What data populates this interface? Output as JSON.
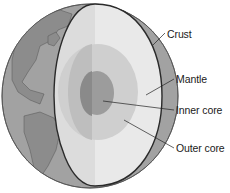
{
  "colors": {
    "background": "#ffffff",
    "globe_ocean": "#9a9a9a",
    "globe_land": "#8a8a8a",
    "outline": "#2a2a2a",
    "crust_mantle_light": "#ececec",
    "crust_mantle_shade": "#dcdcdc",
    "outer_core_light": "#cfcfcf",
    "outer_core_shade": "#bcbcbc",
    "inner_core_light": "#9c9c9c",
    "inner_core_shade": "#8a8a8a",
    "leader_line": "#222222",
    "text": "#1a1a1a"
  },
  "labels": [
    {
      "id": "crust",
      "text": "Crust",
      "x": 167,
      "y": 30
    },
    {
      "id": "mantle",
      "text": "Mantle",
      "x": 176,
      "y": 75
    },
    {
      "id": "inner-core",
      "text": "Inner core",
      "x": 176,
      "y": 104
    },
    {
      "id": "outer-core",
      "text": "Outer core",
      "x": 176,
      "y": 143
    }
  ]
}
